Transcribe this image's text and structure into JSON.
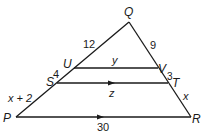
{
  "diagram": {
    "type": "triangle-with-parallel-segments",
    "vertices": {
      "P": "P",
      "Q": "Q",
      "R": "R",
      "S": "S",
      "T": "T",
      "U": "U",
      "V": "V"
    },
    "segment_labels": {
      "QU": "12",
      "US": "4",
      "SP": "x + 2",
      "QV": "9",
      "VT": "3",
      "TR": "x",
      "UV": "y",
      "ST": "z",
      "PR": "30"
    },
    "colors": {
      "stroke": "#1a1a1a",
      "background": "#ffffff"
    }
  }
}
